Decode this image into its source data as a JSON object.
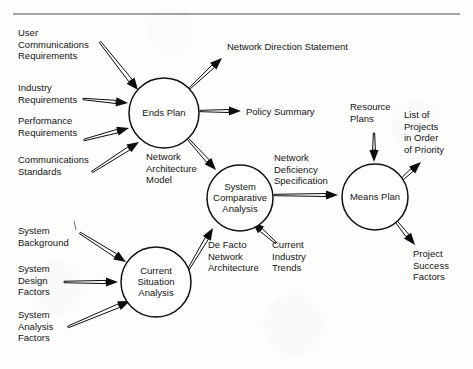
{
  "figure": {
    "type": "data-flow-diagram",
    "width": 473,
    "height": 369,
    "background_color": "#fdfdfc",
    "ink_color": "#0d0d0d",
    "rule_color": "#4a4a4a"
  },
  "divider": {
    "name": "top-horizontal-rule",
    "x1": 13,
    "y1": 14,
    "x2": 460,
    "y2": 14
  },
  "processes": [
    {
      "id": "ends-plan",
      "lines": [
        "Ends Plan"
      ],
      "cx": 164,
      "cy": 113,
      "r": 35
    },
    {
      "id": "system-comparative-analysis",
      "lines": [
        "System",
        "Comparative",
        "Analysis"
      ],
      "cx": 240,
      "cy": 198,
      "r": 33
    },
    {
      "id": "means-plan",
      "lines": [
        "Means Plan"
      ],
      "cx": 375,
      "cy": 197,
      "r": 33
    },
    {
      "id": "current-situation-analysis",
      "lines": [
        "Current",
        "Situation",
        "Analysis"
      ],
      "cx": 156,
      "cy": 282,
      "r": 35
    }
  ],
  "flow_labels": [
    {
      "id": "user-communications-requirements",
      "lines": [
        "User",
        "Communications",
        "Requirements"
      ],
      "x": 18,
      "y": 36,
      "anchor": "start",
      "role": "input",
      "target": "ends-plan"
    },
    {
      "id": "industry-requirements",
      "lines": [
        "Industry",
        "Requirements"
      ],
      "x": 18,
      "y": 91,
      "anchor": "start",
      "role": "input",
      "target": "ends-plan"
    },
    {
      "id": "performance-requirements",
      "lines": [
        "Performance",
        "Requirements"
      ],
      "x": 18,
      "y": 124,
      "anchor": "start",
      "role": "input",
      "target": "ends-plan"
    },
    {
      "id": "communications-standards",
      "lines": [
        "Communications",
        "Standards"
      ],
      "x": 18,
      "y": 163,
      "anchor": "start",
      "role": "input",
      "target": "ends-plan"
    },
    {
      "id": "network-direction-statement",
      "lines": [
        "Network Direction Statement"
      ],
      "x": 227,
      "y": 50,
      "anchor": "start",
      "role": "output",
      "source": "ends-plan"
    },
    {
      "id": "policy-summary",
      "lines": [
        "Policy Summary"
      ],
      "x": 246,
      "y": 115,
      "anchor": "start",
      "role": "output",
      "source": "ends-plan"
    },
    {
      "id": "network-architecture-model",
      "lines": [
        "Network",
        "Architecture",
        "Model"
      ],
      "x": 146,
      "y": 160,
      "anchor": "start",
      "role": "flow",
      "source": "ends-plan",
      "target": "system-comparative-analysis"
    },
    {
      "id": "network-deficiency-specification",
      "lines": [
        "Network",
        "Deficiency",
        "Specification"
      ],
      "x": 274,
      "y": 161,
      "anchor": "start",
      "role": "flow",
      "source": "system-comparative-analysis",
      "target": "means-plan"
    },
    {
      "id": "resource-plans",
      "lines": [
        "Resource",
        "Plans"
      ],
      "x": 350,
      "y": 110,
      "anchor": "start",
      "role": "input",
      "target": "means-plan"
    },
    {
      "id": "list-of-projects-in-order-of-priority",
      "lines": [
        "List of",
        "Projects",
        "in Order",
        "of Priority"
      ],
      "x": 404,
      "y": 118,
      "anchor": "start",
      "role": "output",
      "source": "means-plan"
    },
    {
      "id": "project-success-factors",
      "lines": [
        "Project",
        "Success",
        "Factors"
      ],
      "x": 413,
      "y": 257,
      "anchor": "start",
      "role": "output",
      "source": "means-plan"
    },
    {
      "id": "current-industry-trends",
      "lines": [
        "Current",
        "Industry",
        "Trends"
      ],
      "x": 272,
      "y": 248,
      "anchor": "start",
      "role": "input",
      "target": "system-comparative-analysis"
    },
    {
      "id": "de-facto-network-architecture",
      "lines": [
        "De Facto",
        "Network",
        "Architecture"
      ],
      "x": 208,
      "y": 248,
      "anchor": "start",
      "role": "flow",
      "source": "current-situation-analysis",
      "target": "system-comparative-analysis"
    },
    {
      "id": "system-background",
      "lines": [
        "System",
        "Background"
      ],
      "x": 18,
      "y": 234,
      "anchor": "start",
      "role": "input",
      "target": "current-situation-analysis"
    },
    {
      "id": "system-design-factors",
      "lines": [
        "System",
        "Design",
        "Factors"
      ],
      "x": 18,
      "y": 272,
      "anchor": "start",
      "role": "input",
      "target": "current-situation-analysis"
    },
    {
      "id": "system-analysis-factors",
      "lines": [
        "System",
        "Analysis",
        "Factors"
      ],
      "x": 18,
      "y": 318,
      "anchor": "start",
      "role": "input",
      "target": "current-situation-analysis"
    }
  ],
  "arrows": [
    {
      "id": "arrow-user-communications-requirements",
      "x1": 100,
      "y1": 42,
      "x2": 138,
      "y2": 90,
      "width": 4.0
    },
    {
      "id": "arrow-industry-requirements",
      "x1": 83,
      "y1": 99,
      "x2": 128,
      "y2": 103,
      "width": 3.2
    },
    {
      "id": "arrow-performance-requirements",
      "x1": 84,
      "y1": 140,
      "x2": 129,
      "y2": 128,
      "width": 3.6
    },
    {
      "id": "arrow-communications-standards",
      "x1": 92,
      "y1": 172,
      "x2": 139,
      "y2": 142,
      "width": 3.6
    },
    {
      "id": "arrow-network-direction-statement",
      "x1": 190,
      "y1": 88,
      "x2": 222,
      "y2": 58,
      "width": 3.4
    },
    {
      "id": "arrow-policy-summary",
      "x1": 200,
      "y1": 111,
      "x2": 241,
      "y2": 111,
      "width": 3.0
    },
    {
      "id": "arrow-network-architecture-model",
      "x1": 188,
      "y1": 139,
      "x2": 216,
      "y2": 170,
      "width": 3.6
    },
    {
      "id": "arrow-network-deficiency-specification",
      "x1": 274,
      "y1": 195,
      "x2": 338,
      "y2": 195,
      "width": 3.0
    },
    {
      "id": "arrow-resource-plans",
      "x1": 374,
      "y1": 133,
      "x2": 374,
      "y2": 162,
      "width": 2.8
    },
    {
      "id": "arrow-list-of-projects",
      "x1": 391,
      "y1": 189,
      "x2": 421,
      "y2": 162,
      "width": 3.4
    },
    {
      "id": "arrow-project-success-factors",
      "x1": 391,
      "y1": 215,
      "x2": 415,
      "y2": 245,
      "width": 3.6
    },
    {
      "id": "arrow-current-industry-trends",
      "x1": 276,
      "y1": 243,
      "x2": 252,
      "y2": 222,
      "width": 3.6
    },
    {
      "id": "arrow-de-facto-network-architecture",
      "x1": 188,
      "y1": 270,
      "x2": 213,
      "y2": 228,
      "width": 3.6
    },
    {
      "id": "arrow-system-background",
      "x1": 80,
      "y1": 233,
      "x2": 126,
      "y2": 262,
      "width": 3.8
    },
    {
      "id": "arrow-system-design-factors",
      "x1": 64,
      "y1": 282,
      "x2": 118,
      "y2": 282,
      "width": 3.2
    },
    {
      "id": "arrow-system-analysis-factors",
      "x1": 68,
      "y1": 327,
      "x2": 130,
      "y2": 301,
      "width": 3.8
    }
  ],
  "stray_mark": {
    "id": "stray-pen-tick",
    "x1": 74,
    "y1": 221,
    "x2": 76,
    "y2": 230
  }
}
